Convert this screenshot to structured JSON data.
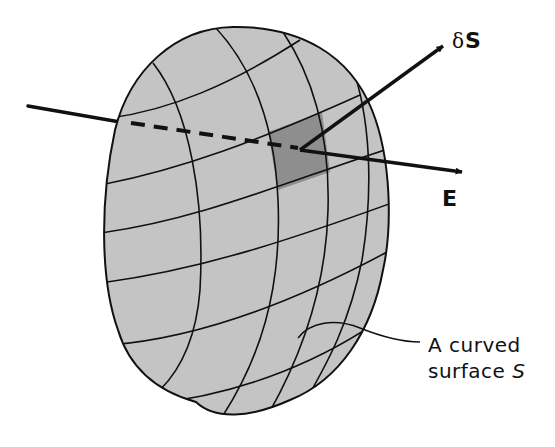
{
  "figure": {
    "type": "diagram",
    "colors": {
      "background": "#ffffff",
      "surface_fill": "#c4c4c4",
      "element_fill": "#8e8e8e",
      "lines": "#111111"
    }
  },
  "labels": {
    "delta_symbol": "δ",
    "dS_letter": "S",
    "E_vector": "E",
    "surface_line1": "A curved",
    "surface_line2_prefix": "surface ",
    "surface_symbol": "S"
  },
  "elements": {
    "surface": "curved surface S (gridded, grey)",
    "surface_element": "small shaded patch δS",
    "vector_dS": "normal vector δS",
    "vector_E": "electric field vector E",
    "field_line": "field line entering surface (dashed behind)"
  }
}
